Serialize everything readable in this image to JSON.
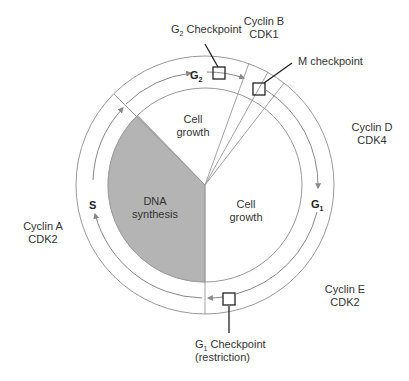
{
  "diagram": {
    "colors": {
      "dna_synthesis_fill": "#b4b4b4",
      "ring_stroke": "#888888",
      "arrow": "#888888",
      "checkpoint_box": "#222222"
    },
    "phases": [
      {
        "id": "S",
        "label": "S",
        "sub": ""
      },
      {
        "id": "G2",
        "label": "G",
        "sub": "2"
      },
      {
        "id": "G1",
        "label": "G",
        "sub": "1"
      }
    ],
    "sectors": [
      {
        "id": "g2-growth",
        "line1": "Cell",
        "line2": "growth"
      },
      {
        "id": "g1-growth",
        "line1": "Cell",
        "line2": "growth"
      },
      {
        "id": "dna-synthesis",
        "line1": "DNA",
        "line2": "synthesis"
      }
    ],
    "checkpoints": [
      {
        "id": "g2",
        "label_pre": "G",
        "label_sub": "2",
        "label_post": " Checkpoint"
      },
      {
        "id": "m",
        "label": "M checkpoint"
      },
      {
        "id": "g1",
        "label_pre": "G",
        "label_sub": "1",
        "label_post": " Checkpoint",
        "line2": "(restriction)"
      }
    ],
    "cyclins": [
      {
        "id": "b",
        "line1": "Cyclin B",
        "line2": "CDK1"
      },
      {
        "id": "d",
        "line1": "Cyclin D",
        "line2": "CDK4"
      },
      {
        "id": "e",
        "line1": "Cyclin E",
        "line2": "CDK2"
      },
      {
        "id": "a",
        "line1": "Cyclin A",
        "line2": "CDK2"
      }
    ]
  }
}
